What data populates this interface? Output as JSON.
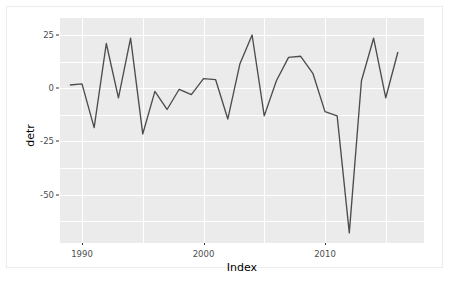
{
  "chart_data": {
    "type": "line",
    "title": "",
    "subtitle": "",
    "xlabel": "Index",
    "ylabel": "detr",
    "xlim": [
      1988.4,
      1988.4
    ],
    "ylim": [
      -70.5,
      27.0
    ],
    "grid": true,
    "legend": null,
    "theme": "ggplot2-grey",
    "line_color": "#4d4d4d",
    "panel_background": "#ebebeb",
    "gridline_color": "#ffffff",
    "x_ticks": [
      1990,
      2000,
      2010
    ],
    "x_tick_labels": [
      "1990",
      "2000",
      "2010"
    ],
    "y_ticks": [
      25,
      0,
      -25,
      -50
    ],
    "y_tick_labels": [
      "25",
      "0",
      "-25",
      "-50"
    ],
    "x": [
      1989,
      1990,
      1991,
      1992,
      1993,
      1994,
      1995,
      1996,
      1997,
      1998,
      1999,
      2000,
      2001,
      2002,
      2003,
      2004,
      2005,
      2006,
      2007,
      2008,
      2009,
      2010,
      2011,
      2012,
      2013,
      2014,
      2015,
      2016
    ],
    "values": [
      1.5,
      2.0,
      -18.5,
      21.0,
      -4.5,
      23.5,
      -21.5,
      -1.5,
      -10.0,
      -0.5,
      -3.0,
      4.5,
      4.0,
      -14.5,
      11.5,
      25.0,
      -13.0,
      3.5,
      14.5,
      15.0,
      7.0,
      -11.0,
      -13.0,
      -68.0,
      3.5,
      23.5,
      -4.5,
      17.0
    ],
    "series_name": "detr"
  },
  "axis": {
    "y_title": "detr",
    "x_title": "Index"
  }
}
